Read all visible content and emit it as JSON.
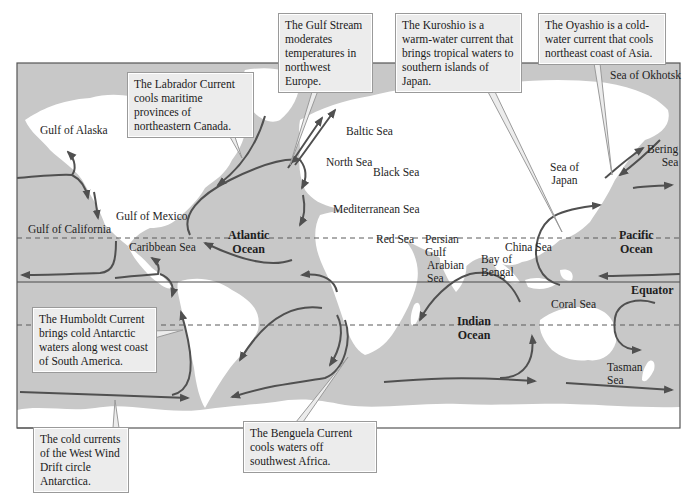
{
  "map": {
    "title": "World ocean currents",
    "colors": {
      "ocean": "#c8c8c8",
      "land": "#ffffff",
      "frame": "#555555",
      "current_arrow": "#505050",
      "callout_bg": "#ececec",
      "callout_border": "#9a9a9a",
      "tropic_dash": "#5a5a5a"
    },
    "oceans": [
      {
        "name": "Atlantic Ocean",
        "line1": "Atlantic",
        "line2": "Ocean"
      },
      {
        "name": "Pacific Ocean",
        "line1": "Pacific",
        "line2": "Ocean"
      },
      {
        "name": "Indian Ocean",
        "line1": "Indian",
        "line2": "Ocean"
      }
    ],
    "equator_label": "Equator",
    "water_bodies": [
      "Gulf of Alaska",
      "Gulf of California",
      "Gulf of Mexico",
      "Caribbean Sea",
      "Baltic Sea",
      "North Sea",
      "Black Sea",
      "Mediterranean Sea",
      "Red Sea",
      "Persian Gulf",
      "Arabian Sea",
      "Bay of Bengal",
      "China Sea",
      "Sea of Japan",
      "Sea of Okhotsk",
      "Bering Sea",
      "Coral Sea",
      "Tasman Sea"
    ],
    "persian_gulf": {
      "line1": "Persian",
      "line2": "Gulf"
    },
    "arabian_sea": {
      "line1": "Arabian",
      "line2": "Sea"
    },
    "bay_of_bengal": {
      "line1": "Bay of",
      "line2": "Bengal"
    },
    "sea_of_japan": {
      "line1": "Sea of",
      "line2": "Japan"
    },
    "bering_sea": {
      "line1": "Bering",
      "line2": "Sea"
    },
    "tasman_sea": {
      "line1": "Tasman",
      "line2": "Sea"
    }
  },
  "callouts": {
    "labrador": "The Labrador Current cools maritime provinces of northeastern Canada.",
    "gulf_stream": "The Gulf Stream moderates temperatures in northwest Europe.",
    "kuroshio": "The Kuroshio is a warm-water current that brings tropical waters to southern islands of Japan.",
    "oyashio": "The Oyashio is a cold-water current that cools northeast coast of Asia.",
    "humboldt": "The Humboldt Current brings cold Antarctic waters along west coast of South America.",
    "west_wind_drift": "The cold currents of the West Wind Drift circle Antarctica.",
    "benguela": "The Benguela Current cools waters off southwest Africa."
  }
}
